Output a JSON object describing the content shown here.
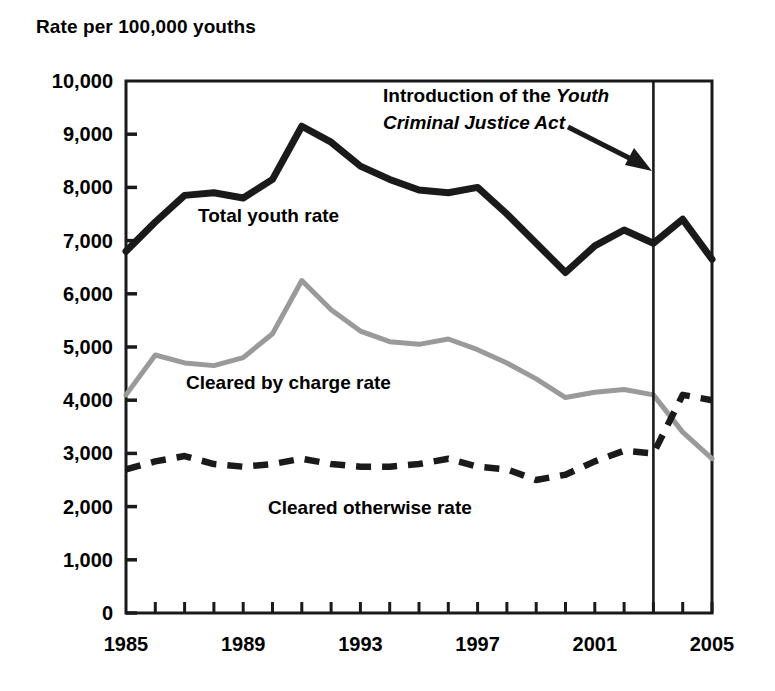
{
  "chart_data": {
    "type": "line",
    "title": "Rate per 100,000 youths",
    "ylabel": "Rate per 100,000 youths",
    "xlabel": "",
    "ylim": [
      0,
      10000
    ],
    "xlim": [
      1985,
      2005
    ],
    "grid": false,
    "legend_position": "inline-labels",
    "ytick_labels": [
      "10,000",
      "9,000",
      "8,000",
      "7,000",
      "6,000",
      "5,000",
      "4,000",
      "3,000",
      "2,000",
      "1,000",
      "0"
    ],
    "ytick_values": [
      10000,
      9000,
      8000,
      7000,
      6000,
      5000,
      4000,
      3000,
      2000,
      1000,
      0
    ],
    "xtick_labels": [
      "1985",
      "1989",
      "1993",
      "1997",
      "2001",
      "2005"
    ],
    "xtick_values": [
      1985,
      1989,
      1993,
      1997,
      2001,
      2005
    ],
    "x": [
      1985,
      1986,
      1987,
      1988,
      1989,
      1990,
      1991,
      1992,
      1993,
      1994,
      1995,
      1996,
      1997,
      1998,
      1999,
      2000,
      2001,
      2002,
      2003,
      2004,
      2005
    ],
    "series": [
      {
        "name": "Total youth rate",
        "style": "solid-black-thick",
        "color": "#1a1a1a",
        "values": [
          6800,
          7350,
          7850,
          7900,
          7800,
          8150,
          9150,
          8850,
          8400,
          8150,
          7950,
          7900,
          8000,
          7500,
          6950,
          6400,
          6900,
          7200,
          6950,
          7400,
          6650
        ]
      },
      {
        "name": "Cleared by charge rate",
        "style": "solid-gray",
        "color": "#9a9a9a",
        "values": [
          4100,
          4850,
          4700,
          4650,
          4800,
          5250,
          6250,
          5700,
          5300,
          5100,
          5050,
          5150,
          4950,
          4700,
          4400,
          4050,
          4150,
          4200,
          4100,
          3400,
          2900
        ]
      },
      {
        "name": "Cleared otherwise rate",
        "style": "dashed-black",
        "color": "#1a1a1a",
        "values": [
          2700,
          2850,
          2950,
          2800,
          2750,
          2800,
          2900,
          2800,
          2750,
          2750,
          2800,
          2900,
          2750,
          2700,
          2500,
          2600,
          2850,
          3050,
          3000,
          4100,
          4000
        ]
      }
    ],
    "annotations": [
      {
        "name": "ycja-annotation",
        "line1_plain": "Introduction of the ",
        "line1_italic": "Youth",
        "line2_italic": "Criminal Justice Act",
        "points_to_year": 2003,
        "marker": "vertical-line"
      }
    ],
    "vertical_marker_year": 2003
  },
  "labels": {
    "axis_title": "Rate per 100,000 youths",
    "series_total": "Total youth rate",
    "series_charge": "Cleared by charge rate",
    "series_otherwise": "Cleared otherwise rate",
    "annotation_line1_plain": "Introduction of the ",
    "annotation_line1_italic": "Youth",
    "annotation_line2_italic": "Criminal Justice Act"
  },
  "yticks": [
    {
      "label": "10,000",
      "value": 10000
    },
    {
      "label": "9,000",
      "value": 9000
    },
    {
      "label": "8,000",
      "value": 8000
    },
    {
      "label": "7,000",
      "value": 7000
    },
    {
      "label": "6,000",
      "value": 6000
    },
    {
      "label": "5,000",
      "value": 5000
    },
    {
      "label": "4,000",
      "value": 4000
    },
    {
      "label": "3,000",
      "value": 3000
    },
    {
      "label": "2,000",
      "value": 2000
    },
    {
      "label": "1,000",
      "value": 1000
    },
    {
      "label": "0",
      "value": 0
    }
  ],
  "xticks": [
    {
      "label": "1985",
      "value": 1985
    },
    {
      "label": "1989",
      "value": 1989
    },
    {
      "label": "1993",
      "value": 1993
    },
    {
      "label": "1997",
      "value": 1997
    },
    {
      "label": "2001",
      "value": 2001
    },
    {
      "label": "2005",
      "value": 2005
    }
  ],
  "colors": {
    "background": "#ffffff",
    "axis": "#1a1a1a",
    "total_youth_rate": "#1a1a1a",
    "cleared_by_charge_rate": "#9a9a9a",
    "cleared_otherwise_rate": "#1a1a1a"
  }
}
